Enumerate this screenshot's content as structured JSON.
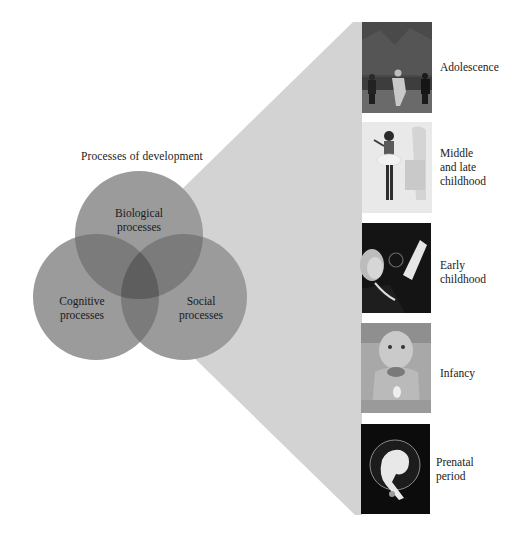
{
  "diagram": {
    "title": "Processes of development",
    "circles": [
      {
        "id": "biological",
        "label_line1": "Biological",
        "label_line2": "processes"
      },
      {
        "id": "cognitive",
        "label_line1": "Cognitive",
        "label_line2": "processes"
      },
      {
        "id": "social",
        "label_line1": "Social",
        "label_line2": "processes"
      }
    ],
    "stages": [
      {
        "label_lines": [
          "Adolescence"
        ],
        "photo": "children-running-photo"
      },
      {
        "label_lines": [
          "Middle",
          "and late",
          "childhood"
        ],
        "photo": "girl-dancing-photo"
      },
      {
        "label_lines": [
          "Early",
          "childhood"
        ],
        "photo": "toddler-bubbles-photo"
      },
      {
        "label_lines": [
          "Infancy"
        ],
        "photo": "infant-photo"
      },
      {
        "label_lines": [
          "Prenatal",
          "period"
        ],
        "photo": "fetus-photo"
      }
    ],
    "colors": {
      "wedge": "#d3d3d3",
      "circle_fill": "#9b9b9b",
      "overlap_two": "#7b7b7b",
      "overlap_three": "#5e5e5e",
      "text": "#1a1a1a"
    }
  }
}
